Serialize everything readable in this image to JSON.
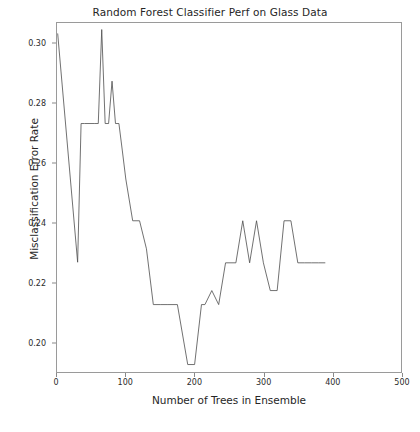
{
  "chart_data": {
    "type": "line",
    "title": "Random Forest Classifier Perf on Glass Data",
    "xlabel": "Number of Trees in Ensemble",
    "ylabel": "Misclassification Error Rate",
    "xlim": [
      0,
      500
    ],
    "ylim": [
      0.19,
      0.307
    ],
    "xticks": [
      0,
      100,
      200,
      300,
      400,
      500
    ],
    "xticklabels": [
      "0",
      "100",
      "200",
      "300",
      "400",
      "500"
    ],
    "yticks": [
      0.2,
      0.22,
      0.24,
      0.26,
      0.28,
      0.3
    ],
    "yticklabels": [
      "0.20",
      "0.22",
      "0.24",
      "0.26",
      "0.28",
      "0.30"
    ],
    "grid": false,
    "legend": null,
    "line_color": "#4d4d4d",
    "line_width": 0.8,
    "x": [
      1,
      30,
      35,
      40,
      55,
      60,
      65,
      70,
      75,
      80,
      85,
      90,
      95,
      100,
      110,
      120,
      130,
      140,
      150,
      160,
      175,
      190,
      200,
      210,
      215,
      225,
      235,
      245,
      250,
      260,
      270,
      280,
      290,
      300,
      310,
      320,
      330,
      340,
      350,
      360,
      370,
      380,
      390
    ],
    "y": [
      0.3035,
      0.2268,
      0.2733,
      0.2733,
      0.2733,
      0.2733,
      0.3048,
      0.2733,
      0.2733,
      0.2875,
      0.2733,
      0.2733,
      0.2641,
      0.2547,
      0.2407,
      0.2407,
      0.2313,
      0.2126,
      0.2126,
      0.2126,
      0.2126,
      0.1925,
      0.1925,
      0.2126,
      0.2126,
      0.2173,
      0.2126,
      0.2266,
      0.2266,
      0.2266,
      0.2407,
      0.2266,
      0.2407,
      0.2266,
      0.2173,
      0.2173,
      0.2407,
      0.2407,
      0.2266,
      0.2266,
      0.2266,
      0.2266,
      0.2266
    ],
    "annotations": []
  }
}
